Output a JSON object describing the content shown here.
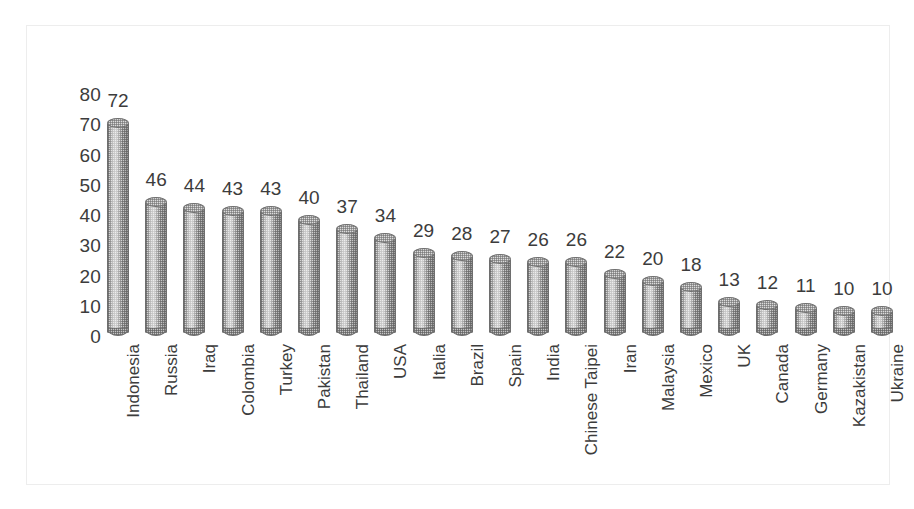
{
  "chart_data": {
    "type": "bar",
    "title": "",
    "subtitle": "",
    "xlabel": "",
    "ylabel": "",
    "ylim": [
      0,
      80
    ],
    "yticks": [
      80,
      70,
      60,
      50,
      40,
      30,
      20,
      10,
      0
    ],
    "grid": false,
    "legend": false,
    "legend_position": "none",
    "bar_style": "3d-cylinder",
    "bar_color": "#c9c9c9",
    "bar_outline_color": "#6e6e6e",
    "text_color": "#3c3c3c",
    "frame_color": "#ededed",
    "background_color": "#ffffff",
    "data_labels": true,
    "categories": [
      "Indonesia",
      "Russia",
      "Iraq",
      "Colombia",
      "Turkey",
      "Pakistan",
      "Thailand",
      "USA",
      "Italia",
      "Brazil",
      "Spain",
      "India",
      "Chinese Taipei",
      "Iran",
      "Malaysia",
      "Mexico",
      "UK",
      "Canada",
      "Germany",
      "Kazakistan",
      "Ukraine"
    ],
    "values": [
      72,
      46,
      44,
      43,
      43,
      40,
      37,
      34,
      29,
      28,
      27,
      26,
      26,
      22,
      20,
      18,
      13,
      12,
      11,
      10,
      10
    ]
  }
}
